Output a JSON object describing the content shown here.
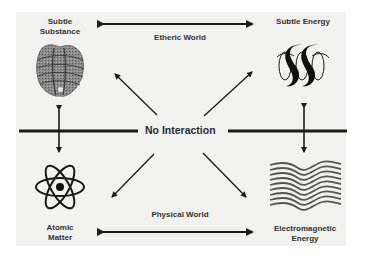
{
  "diagram": {
    "center_label": "No Interaction",
    "top_axis_label": "Etheric World",
    "bottom_axis_label": "Physical World",
    "nodes": [
      {
        "id": "subtle-substance",
        "label_line1": "Subtle",
        "label_line2": "Substance",
        "icon": "textured-sphere-icon",
        "position": "top-left"
      },
      {
        "id": "subtle-energy",
        "label_line1": "Subtle Energy",
        "icon": "helix-spiral-icon",
        "position": "top-right"
      },
      {
        "id": "atomic-matter",
        "label_line1": "Atomic",
        "label_line2": "Matter",
        "icon": "atom-icon",
        "position": "bottom-left"
      },
      {
        "id": "electromagnetic-energy",
        "label_line1": "Electromagnetic",
        "label_line2": "Energy",
        "icon": "waves-icon",
        "position": "bottom-right"
      }
    ],
    "connections": [
      {
        "from": "subtle-substance",
        "to": "subtle-energy",
        "type": "double-arrow",
        "label": "Etheric World"
      },
      {
        "from": "atomic-matter",
        "to": "electromagnetic-energy",
        "type": "double-arrow",
        "label": "Physical World"
      },
      {
        "from": "subtle-substance",
        "to": "atomic-matter",
        "type": "double-arrow"
      },
      {
        "from": "subtle-energy",
        "to": "electromagnetic-energy",
        "type": "double-arrow"
      },
      {
        "from": "center",
        "to": "subtle-substance",
        "type": "arrow"
      },
      {
        "from": "center",
        "to": "subtle-energy",
        "type": "arrow"
      },
      {
        "from": "center",
        "to": "atomic-matter",
        "type": "arrow"
      },
      {
        "from": "center",
        "to": "electromagnetic-energy",
        "type": "arrow"
      }
    ],
    "colors": {
      "panel": "#f1f1f0",
      "ink": "#1a1a1a",
      "text": "#333333",
      "wave": "#555555"
    }
  }
}
